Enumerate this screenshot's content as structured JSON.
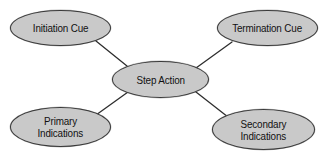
{
  "diagram": {
    "background_color": "#ffffff",
    "node_fill_color": "#c9c9c9",
    "node_border_color": "#3a3a3a",
    "edge_color": "#2e2e2e",
    "nodes": [
      {
        "id": "initiation-cue",
        "label_line1": "Initiation Cue",
        "label_line2": ""
      },
      {
        "id": "termination-cue",
        "label_line1": "Termination Cue",
        "label_line2": ""
      },
      {
        "id": "step-action",
        "label_line1": "Step Action",
        "label_line2": ""
      },
      {
        "id": "primary-indications",
        "label_line1": "Primary",
        "label_line2": "Indications"
      },
      {
        "id": "secondary-indications",
        "label_line1": "Secondary",
        "label_line2": "Indications"
      }
    ],
    "edges": [
      {
        "id": "edge-initiation-to-step",
        "from": "initiation-cue",
        "to": "step-action",
        "x1": 96,
        "y1": 41,
        "x2": 127,
        "y2": 66
      },
      {
        "id": "edge-step-to-termination",
        "from": "step-action",
        "to": "termination-cue",
        "x1": 196,
        "y1": 68,
        "x2": 232,
        "y2": 42
      },
      {
        "id": "edge-primary-to-step",
        "from": "primary-indications",
        "to": "step-action",
        "x1": 96,
        "y1": 115,
        "x2": 128,
        "y2": 92
      },
      {
        "id": "edge-step-to-secondary",
        "from": "step-action",
        "to": "secondary-indications",
        "x1": 196,
        "y1": 92,
        "x2": 228,
        "y2": 117
      }
    ]
  }
}
